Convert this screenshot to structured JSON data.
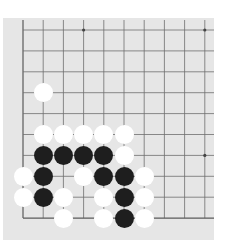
{
  "board": {
    "colors": {
      "background": "#e6e6e6",
      "line": "#6e6e6e",
      "edge_line": "#5a5a5a",
      "black_stone": "#1e1e1e",
      "white_stone": "#ffffff",
      "star_point": "#444444"
    },
    "view": "bottom-left corner fragment",
    "columns_visible": 10,
    "rows_visible": 10,
    "edges": [
      "left",
      "bottom"
    ],
    "star_points": [
      {
        "col": 3,
        "row": 0
      },
      {
        "col": 9,
        "row": 0
      },
      {
        "col": 9,
        "row": 6
      }
    ],
    "stones": [
      {
        "color": "white",
        "col": 1,
        "row": 3
      },
      {
        "color": "white",
        "col": 1,
        "row": 5
      },
      {
        "color": "white",
        "col": 2,
        "row": 5
      },
      {
        "color": "white",
        "col": 3,
        "row": 5
      },
      {
        "color": "white",
        "col": 4,
        "row": 5
      },
      {
        "color": "white",
        "col": 5,
        "row": 5
      },
      {
        "color": "black",
        "col": 1,
        "row": 6
      },
      {
        "color": "black",
        "col": 2,
        "row": 6
      },
      {
        "color": "black",
        "col": 3,
        "row": 6
      },
      {
        "color": "black",
        "col": 4,
        "row": 6
      },
      {
        "color": "white",
        "col": 5,
        "row": 6
      },
      {
        "color": "white",
        "col": 0,
        "row": 7
      },
      {
        "color": "black",
        "col": 1,
        "row": 7
      },
      {
        "color": "white",
        "col": 3,
        "row": 7
      },
      {
        "color": "black",
        "col": 4,
        "row": 7
      },
      {
        "color": "black",
        "col": 5,
        "row": 7
      },
      {
        "color": "white",
        "col": 6,
        "row": 7
      },
      {
        "color": "white",
        "col": 0,
        "row": 8
      },
      {
        "color": "black",
        "col": 1,
        "row": 8
      },
      {
        "color": "white",
        "col": 2,
        "row": 8
      },
      {
        "color": "white",
        "col": 4,
        "row": 8
      },
      {
        "color": "black",
        "col": 5,
        "row": 8
      },
      {
        "color": "white",
        "col": 6,
        "row": 8
      },
      {
        "color": "white",
        "col": 2,
        "row": 9
      },
      {
        "color": "white",
        "col": 4,
        "row": 9
      },
      {
        "color": "black",
        "col": 5,
        "row": 9
      },
      {
        "color": "white",
        "col": 6,
        "row": 9
      }
    ]
  }
}
